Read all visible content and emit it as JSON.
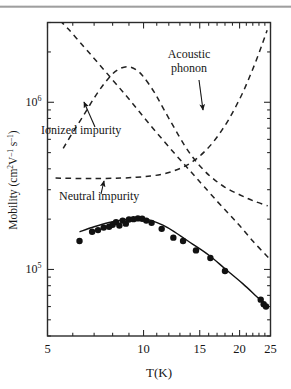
{
  "figure": {
    "title": "",
    "background_color": "#ffffff",
    "ink_color": "#161616"
  },
  "chart_data": {
    "type": "line",
    "title": "",
    "subtitle": "",
    "xlabel": "T(K)",
    "ylabel": "Mobility (cm²V⁻¹s⁻¹)",
    "xscale": "log",
    "yscale": "log",
    "xlim": [
      5,
      25
    ],
    "ylim": [
      40000,
      3000000
    ],
    "grid": false,
    "legend": "none",
    "xticks": [
      5,
      10,
      15,
      20,
      25
    ],
    "xticklabels": [
      "5",
      "10",
      "15",
      "20",
      "25"
    ],
    "yticks": [
      100000,
      1000000
    ],
    "yticklabels": [
      "10⁵",
      "10⁶"
    ],
    "ytick_label_base": "10",
    "ytick_label_exponents": [
      "5",
      "6"
    ],
    "series": [
      {
        "name": "Experiment",
        "style": "solid-line-with-markers",
        "marker": "filled-circle",
        "color": "#111111",
        "x": [
          6.3,
          6.9,
          7.2,
          7.5,
          7.8,
          8.0,
          8.2,
          8.4,
          8.6,
          8.8,
          9.0,
          9.3,
          9.6,
          9.9,
          10.2,
          10.6,
          11.4,
          12.4,
          13.3,
          14.6,
          16.2,
          18.0,
          23.3,
          23.8,
          24.2
        ],
        "y": [
          148000,
          168000,
          172000,
          178000,
          180000,
          185000,
          192000,
          183000,
          196000,
          188000,
          199000,
          200000,
          202000,
          201000,
          196000,
          190000,
          175000,
          155000,
          148000,
          130000,
          117000,
          98000,
          66000,
          62000,
          60000
        ]
      },
      {
        "name": "Experiment fit",
        "style": "solid-line",
        "color": "#111111",
        "x": [
          6.3,
          7.0,
          7.8,
          8.6,
          9.4,
          10.0,
          10.6,
          11.5,
          12.5,
          14.0,
          16.0,
          18.0,
          20.5,
          23.0,
          24.4
        ],
        "y": [
          168000,
          180000,
          191000,
          198000,
          202000,
          201000,
          196000,
          184000,
          168000,
          145000,
          122000,
          101000,
          82000,
          67000,
          61000
        ]
      },
      {
        "name": "Ionized impurity",
        "style": "dashed",
        "color": "#222222",
        "x": [
          5.6,
          6.0,
          6.5,
          7.0,
          7.5,
          8.0,
          8.5,
          9.0,
          9.5,
          10.0,
          10.8,
          11.6,
          12.5,
          13.5,
          14.5,
          15.5,
          16.5,
          18.0,
          20.0,
          22.0,
          24.5
        ],
        "y": [
          530000,
          660000,
          840000,
          1060000,
          1280000,
          1480000,
          1600000,
          1630000,
          1560000,
          1420000,
          1150000,
          900000,
          700000,
          545000,
          450000,
          390000,
          350000,
          310000,
          280000,
          258000,
          240000
        ]
      },
      {
        "name": "Acoustic phonon",
        "style": "dashed",
        "color": "#222222",
        "x": [
          5.2,
          5.8,
          6.5,
          7.2,
          8.0,
          8.8,
          9.6,
          10.5,
          11.5,
          12.5,
          13.5,
          14.5,
          15.5,
          17.0,
          18.5,
          20.0,
          22.0,
          24.6
        ],
        "y": [
          3400000,
          2750000,
          2150000,
          1720000,
          1360000,
          1100000,
          900000,
          730000,
          595000,
          495000,
          420000,
          360000,
          312000,
          256000,
          215000,
          183000,
          148000,
          118000
        ]
      },
      {
        "name": "Neutral impurity",
        "style": "dashed",
        "color": "#222222",
        "x": [
          5.3,
          6.5,
          7.5,
          8.5,
          9.5,
          10.5,
          11.5,
          12.5,
          13.5,
          14.5,
          15.5,
          16.5,
          17.5,
          18.5,
          19.5,
          20.5,
          21.5,
          22.5,
          23.5,
          24.4
        ],
        "y": [
          352000,
          350000,
          350000,
          352000,
          356000,
          362000,
          372000,
          390000,
          415000,
          452000,
          505000,
          575000,
          670000,
          790000,
          950000,
          1150000,
          1420000,
          1760000,
          2200000,
          2700000
        ]
      }
    ],
    "annotations": [
      {
        "id": "ionized-impurity",
        "text_line1": "Ionized impurity",
        "text": "Ionized impurity",
        "label_x": 41,
        "label_y": 134,
        "arrow_from_x": 95,
        "arrow_from_y": 127,
        "arrow_to_x": 84,
        "arrow_to_y": 102
      },
      {
        "id": "acoustic-phonon",
        "text_line1": "Acoustic",
        "text_line2": "phonon",
        "text": "Acoustic phonon",
        "label_x": 189,
        "label_y": 58,
        "arrow_from_x": 199,
        "arrow_from_y": 80,
        "arrow_to_x": 203,
        "arrow_to_y": 110
      },
      {
        "id": "neutral-impurity",
        "text_line1": "Neutral impurity",
        "text": "Neutral impurity",
        "label_x": 59,
        "label_y": 200,
        "arrow_from_x": 101,
        "arrow_from_y": 194,
        "arrow_to_x": 104,
        "arrow_to_y": 181
      }
    ]
  }
}
